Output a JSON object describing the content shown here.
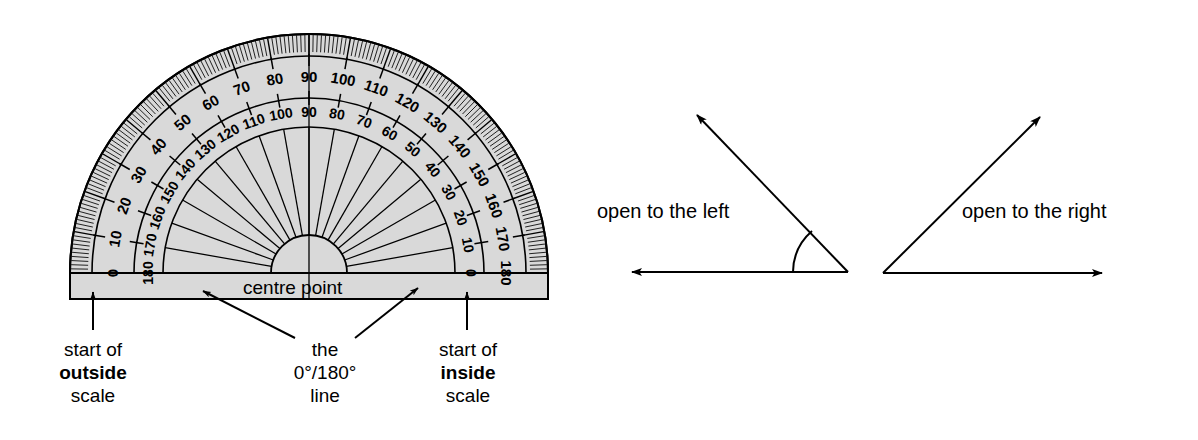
{
  "figure": {
    "background_color": "#ffffff",
    "ink_color": "#000000",
    "protractor_fill": "#d9d9d9"
  },
  "protractor": {
    "centre_label": "centre point",
    "outside_scale": {
      "name": "outside scale",
      "direction": "left-to-right 0 to 180",
      "labels": [
        "0",
        "10",
        "20",
        "30",
        "40",
        "50",
        "60",
        "70",
        "80",
        "90",
        "100",
        "110",
        "120",
        "130",
        "140",
        "150",
        "160",
        "170",
        "180"
      ],
      "values": [
        0,
        10,
        20,
        30,
        40,
        50,
        60,
        70,
        80,
        90,
        100,
        110,
        120,
        130,
        140,
        150,
        160,
        170,
        180
      ]
    },
    "inside_scale": {
      "name": "inside scale",
      "direction": "left-to-right 180 to 0",
      "labels": [
        "180",
        "170",
        "160",
        "150",
        "140",
        "130",
        "120",
        "110",
        "100",
        "90",
        "80",
        "70",
        "60",
        "50",
        "40",
        "30",
        "20",
        "10",
        "0"
      ],
      "values": [
        180,
        170,
        160,
        150,
        140,
        130,
        120,
        110,
        100,
        90,
        80,
        70,
        60,
        50,
        40,
        30,
        20,
        10,
        0
      ]
    },
    "tick_spacing_degrees": 1,
    "major_tick_spacing_degrees": 10
  },
  "callouts": [
    {
      "id": "outside-scale-callout",
      "line1": "start of",
      "line2": "outside",
      "line3": "scale",
      "bold_line": 2
    },
    {
      "id": "zero-one-eighty-line-callout",
      "line1": "the",
      "line2": "0°/180°",
      "line3": "line",
      "bold_line": 0
    },
    {
      "id": "inside-scale-callout",
      "line1": "start of",
      "line2": "inside",
      "line3": "scale",
      "bold_line": 2
    }
  ],
  "angles": [
    {
      "id": "open-to-the-left",
      "label": "open to the left",
      "vertex_side": "right",
      "has_arc": true
    },
    {
      "id": "open-to-the-right",
      "label": "open to the right",
      "vertex_side": "left",
      "has_arc": false
    }
  ]
}
